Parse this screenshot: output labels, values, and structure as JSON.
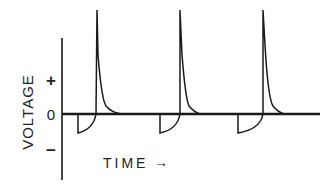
{
  "diagram": {
    "y_axis_label": "VOLTAGE",
    "x_axis_label": "TIME",
    "x_axis_arrow": "→",
    "y_ticks": {
      "plus": "+",
      "zero": "0",
      "minus": "−"
    },
    "line_color": "#1a1a1a",
    "pulses": [
      {
        "dip_x": 78,
        "spike_x": 96
      },
      {
        "dip_x": 160,
        "spike_x": 180
      },
      {
        "dip_x": 238,
        "spike_x": 264
      }
    ]
  }
}
